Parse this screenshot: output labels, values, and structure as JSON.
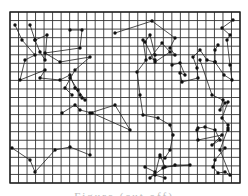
{
  "figure": {
    "grid": {
      "x0": 10,
      "y0": 12,
      "x1": 240,
      "y1": 183,
      "cols": 27,
      "rows": 20,
      "line_color": "#333333",
      "border_color": "#222222"
    },
    "path_color": "#222222",
    "node_color": "#111111",
    "caption": "Figure (cut off)",
    "routes": [
      [
        [
          15,
          25
        ],
        [
          22,
          40
        ],
        [
          35,
          55
        ],
        [
          25,
          60
        ],
        [
          20,
          80
        ],
        [
          45,
          70
        ],
        [
          40,
          78
        ],
        [
          60,
          80
        ],
        [
          70,
          75
        ],
        [
          75,
          88
        ],
        [
          80,
          95
        ],
        [
          82,
          98
        ],
        [
          85,
          100
        ],
        [
          78,
          90
        ],
        [
          70,
          78
        ]
      ],
      [
        [
          30,
          25
        ],
        [
          35,
          40
        ],
        [
          40,
          52
        ],
        [
          45,
          60
        ],
        [
          47,
          35
        ],
        [
          35,
          40
        ]
      ],
      [
        [
          70,
          30
        ],
        [
          82,
          30
        ],
        [
          80,
          48
        ],
        [
          45,
          53
        ],
        [
          60,
          62
        ],
        [
          90,
          57
        ],
        [
          75,
          70
        ],
        [
          65,
          88
        ],
        [
          72,
          95
        ]
      ],
      [
        [
          62,
          113
        ],
        [
          75,
          105
        ],
        [
          80,
          110
        ],
        [
          92,
          113
        ],
        [
          130,
          130
        ],
        [
          115,
          105
        ],
        [
          90,
          113
        ],
        [
          90,
          155
        ],
        [
          70,
          147
        ],
        [
          55,
          150
        ],
        [
          35,
          172
        ],
        [
          30,
          160
        ],
        [
          12,
          148
        ]
      ],
      [
        [
          115,
          33
        ],
        [
          152,
          21
        ],
        [
          175,
          38
        ],
        [
          170,
          48
        ],
        [
          175,
          55
        ],
        [
          155,
          55
        ],
        [
          150,
          35
        ],
        [
          145,
          42
        ],
        [
          155,
          62
        ],
        [
          170,
          52
        ],
        [
          162,
          43
        ],
        [
          150,
          58
        ],
        [
          155,
          60
        ]
      ],
      [
        [
          143,
          40
        ],
        [
          146,
          60
        ],
        [
          137,
          72
        ],
        [
          140,
          95
        ],
        [
          143,
          115
        ],
        [
          158,
          118
        ],
        [
          170,
          125
        ],
        [
          173,
          135
        ],
        [
          170,
          150
        ],
        [
          165,
          158
        ],
        [
          160,
          157
        ]
      ],
      [
        [
          172,
          65
        ],
        [
          180,
          63
        ],
        [
          185,
          75
        ],
        [
          180,
          73
        ],
        [
          182,
          82
        ],
        [
          198,
          78
        ],
        [
          197,
          68
        ],
        [
          193,
          57
        ],
        [
          200,
          50
        ],
        [
          207,
          60
        ],
        [
          215,
          62
        ],
        [
          215,
          50
        ],
        [
          218,
          45
        ]
      ],
      [
        [
          200,
          60
        ],
        [
          212,
          95
        ],
        [
          223,
          100
        ],
        [
          220,
          110
        ],
        [
          225,
          103
        ],
        [
          228,
          102
        ],
        [
          222,
          118
        ],
        [
          228,
          125
        ],
        [
          228,
          130
        ]
      ],
      [
        [
          233,
          20
        ],
        [
          222,
          28
        ],
        [
          230,
          35
        ],
        [
          227,
          40
        ],
        [
          230,
          65
        ],
        [
          232,
          80
        ],
        [
          224,
          75
        ],
        [
          215,
          62
        ]
      ],
      [
        [
          198,
          128
        ],
        [
          205,
          127
        ],
        [
          215,
          130
        ],
        [
          220,
          140
        ],
        [
          212,
          145
        ],
        [
          222,
          135
        ],
        [
          198,
          140
        ],
        [
          197,
          130
        ]
      ],
      [
        [
          225,
          148
        ],
        [
          215,
          160
        ],
        [
          213,
          167
        ],
        [
          218,
          173
        ],
        [
          225,
          172
        ],
        [
          230,
          175
        ],
        [
          220,
          150
        ],
        [
          228,
          128
        ]
      ],
      [
        [
          145,
          167
        ],
        [
          155,
          172
        ],
        [
          150,
          178
        ],
        [
          163,
          168
        ],
        [
          175,
          165
        ],
        [
          190,
          165
        ],
        [
          165,
          167
        ],
        [
          160,
          155
        ],
        [
          155,
          175
        ],
        [
          165,
          178
        ]
      ]
    ]
  }
}
